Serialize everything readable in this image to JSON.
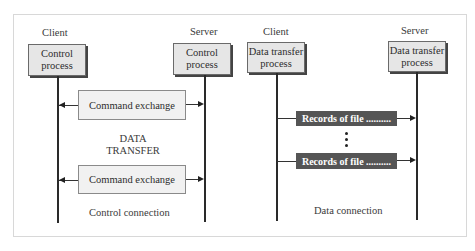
{
  "diagram": {
    "control_side": {
      "client_label": "Client",
      "server_label": "Server",
      "client_process": [
        "Control",
        "process"
      ],
      "server_process": [
        "Control",
        "process"
      ],
      "command_exchange_1": "Command exchange",
      "command_exchange_2": "Command exchange",
      "data_transfer_text": [
        "DATA",
        "TRANSFER"
      ],
      "caption": "Control connection"
    },
    "data_side": {
      "client_label": "Client",
      "server_label": "Server",
      "client_process": [
        "Data transfer",
        "process"
      ],
      "server_process": [
        "Data transfer",
        "process"
      ],
      "record_1": "Records of file ..........",
      "record_2": "Records of file ..........",
      "ellipsis": "vertical-dots",
      "caption": "Data connection"
    },
    "colors": {
      "process_box_fill": "#e6e6e6",
      "command_box_fill": "#f1f1f1",
      "record_box_fill": "#555555",
      "line": "#2a2a2a"
    }
  }
}
